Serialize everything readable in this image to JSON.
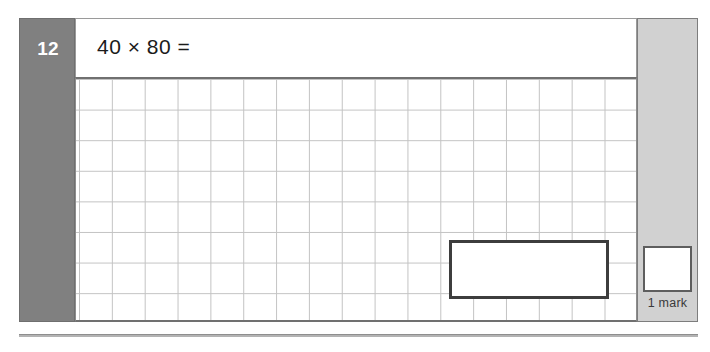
{
  "question": {
    "number": "12",
    "text": "40 × 80 =",
    "operands": [
      40,
      80
    ],
    "operator": "×",
    "answer_box_value": ""
  },
  "marking": {
    "score_value": "",
    "label": "1 mark",
    "marks_available": 1
  },
  "grid": {
    "columns": 17,
    "rows": 8,
    "cell_width_px": 33,
    "cell_height_px": 31
  },
  "colors": {
    "question_number_bg": "#808080",
    "question_number_text": "#ffffff",
    "mark_panel_bg": "#d1d1d1",
    "grid_line": "#c3c3c3",
    "answer_box_border": "#3d3d3d",
    "page_rule": "#b3b3b3"
  }
}
